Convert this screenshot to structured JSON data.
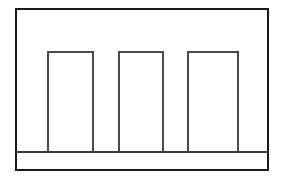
{
  "figure": {
    "canvas": {
      "width": 285,
      "height": 185,
      "background": "#ffffff"
    },
    "outer_frame": {
      "label": "outer rectangular border",
      "x": 16,
      "y": 9,
      "width": 252,
      "height": 161,
      "stroke": "#1a1a1a",
      "stroke_width": 2.2,
      "fill": "none"
    },
    "baseline": {
      "label": "horizontal baseline under bars",
      "x1": 16,
      "y1": 152,
      "x2": 268,
      "y2": 152,
      "stroke": "#3a3a3a",
      "stroke_width": 1.8
    },
    "bars": [
      {
        "name": "bar-1",
        "x": 48,
        "y": 52,
        "width": 45,
        "height": 100,
        "stroke": "#4a4a4a",
        "stroke_width": 1.3,
        "fill": "#ffffff"
      },
      {
        "name": "bar-2",
        "x": 119,
        "y": 52,
        "width": 44,
        "height": 100,
        "stroke": "#4a4a4a",
        "stroke_width": 1.3,
        "fill": "#ffffff"
      },
      {
        "name": "bar-3",
        "x": 188,
        "y": 52,
        "width": 50,
        "height": 100,
        "stroke": "#4a4a4a",
        "stroke_width": 1.3,
        "fill": "#ffffff"
      }
    ]
  },
  "chart_data": {
    "type": "bar",
    "title": "",
    "xlabel": "",
    "ylabel": "",
    "categories": [
      "1",
      "2",
      "3"
    ],
    "values": [
      100,
      100,
      100
    ],
    "ylim": [
      0,
      143
    ],
    "grid": false,
    "legend": null
  }
}
